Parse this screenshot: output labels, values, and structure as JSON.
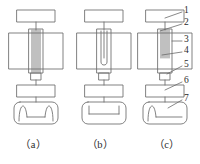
{
  "figure": {
    "type": "technical-line-diagram",
    "background_color": "#ffffff",
    "line_color": "#6b6b6b",
    "text_color": "#2b2b2b",
    "panels": [
      {
        "caption": "（a）",
        "column_interior": "full-height-parallel-coil-lines",
        "base_interior": "two-inward-hooks"
      },
      {
        "caption": "（b）",
        "column_interior": "u-shaped-loop",
        "base_interior": "two-short-vertical-ticks"
      },
      {
        "caption": "（c）",
        "column_interior": "upper-partial-coil-lines",
        "base_interior": "single-left-hook"
      }
    ],
    "callouts": [
      {
        "number": "1",
        "target": "top-rectangle"
      },
      {
        "number": "2",
        "target": "column-coil-top"
      },
      {
        "number": "3",
        "target": "main-body-rectangle"
      },
      {
        "number": "4",
        "target": "column-coil-bottom"
      },
      {
        "number": "5",
        "target": "neck-connector"
      },
      {
        "number": "6",
        "target": "small-rectangle"
      },
      {
        "number": "7",
        "target": "rounded-base"
      }
    ]
  }
}
